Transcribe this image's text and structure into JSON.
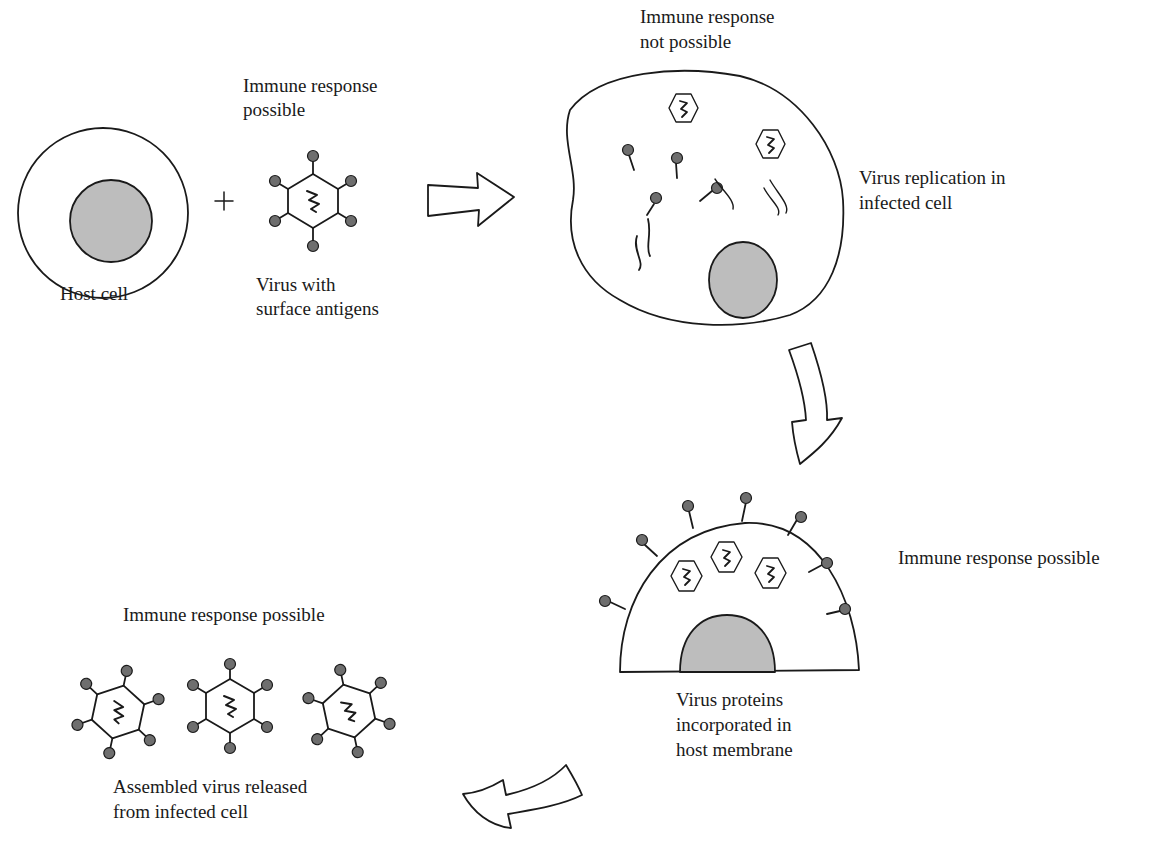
{
  "diagram": {
    "type": "virus-infection-cycle",
    "colors": {
      "stroke": "#1a1a1a",
      "nucleus_fill": "#bdbdbd",
      "antigen_fill": "#6e6e6e",
      "background": "#ffffff"
    },
    "stages": [
      {
        "id": "host-plus-virus",
        "host_label": "Host cell",
        "plus_symbol": "+",
        "virus_top_label_line1": "Immune response",
        "virus_top_label_line2": "possible",
        "virus_bottom_label_line1": "Virus with",
        "virus_bottom_label_line2": "surface antigens"
      },
      {
        "id": "infected-cell",
        "top_label_line1": "Immune response",
        "top_label_line2": "not possible",
        "side_label_line1": "Virus replication in",
        "side_label_line2": "infected cell"
      },
      {
        "id": "membrane-incorporation",
        "side_label": "Immune response possible",
        "bottom_label_line1": "Virus proteins",
        "bottom_label_line2": "incorporated in",
        "bottom_label_line3": "host membrane"
      },
      {
        "id": "virus-release",
        "top_label": "Immune response possible",
        "bottom_label_line1": "Assembled virus released",
        "bottom_label_line2": "from infected cell"
      }
    ],
    "arrows": [
      {
        "id": "arrow-right",
        "direction": "right"
      },
      {
        "id": "arrow-down",
        "direction": "down"
      },
      {
        "id": "arrow-down-left",
        "direction": "down-left"
      }
    ]
  }
}
